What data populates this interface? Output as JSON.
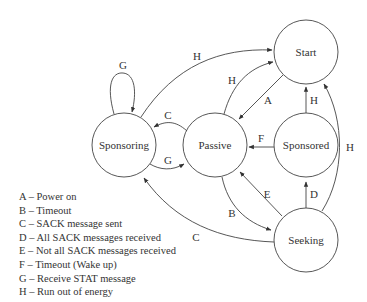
{
  "diagram": {
    "type": "state-transition",
    "states": [
      {
        "id": "start",
        "label": "Start"
      },
      {
        "id": "sponsoring",
        "label": "Sponsoring"
      },
      {
        "id": "passive",
        "label": "Passive"
      },
      {
        "id": "sponsored",
        "label": "Sponsored"
      },
      {
        "id": "seeking",
        "label": "Seeking"
      }
    ],
    "transitions": [
      {
        "from": "sponsoring",
        "to": "sponsoring",
        "label": "G"
      },
      {
        "from": "sponsoring",
        "to": "start",
        "label": "H"
      },
      {
        "from": "passive",
        "to": "start",
        "label": "H"
      },
      {
        "from": "start",
        "to": "passive",
        "label": "A"
      },
      {
        "from": "sponsored",
        "to": "start",
        "label": "H"
      },
      {
        "from": "seeking",
        "to": "start",
        "label": "H"
      },
      {
        "from": "passive",
        "to": "sponsoring",
        "label": "C"
      },
      {
        "from": "sponsoring",
        "to": "passive",
        "label": "G"
      },
      {
        "from": "sponsored",
        "to": "passive",
        "label": "F"
      },
      {
        "from": "passive",
        "to": "seeking",
        "label": "B"
      },
      {
        "from": "seeking",
        "to": "passive",
        "label": "E"
      },
      {
        "from": "seeking",
        "to": "sponsored",
        "label": "D"
      },
      {
        "from": "seeking",
        "to": "sponsoring",
        "label": "C"
      }
    ],
    "legend": [
      "A – Power on",
      "B – Timeout",
      "C – SACK message sent",
      "D – All SACK messages received",
      "E – Not all SACK messages received",
      "F – Timeout (Wake up)",
      "G – Receive STAT message",
      "H – Run out of energy"
    ]
  }
}
